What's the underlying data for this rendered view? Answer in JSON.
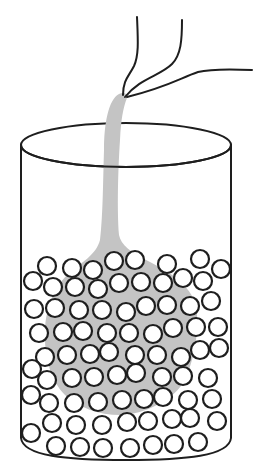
{
  "figure": {
    "title": "Liquid poured from tubes into a cylinder packed with beads",
    "colors": {
      "ink": "#1e1e1e",
      "liquid": "#c4c4c4",
      "background": "#ffffff",
      "bead_fill": "#ffffff"
    },
    "cylinder": {
      "top_ellipse": {
        "cx": 126,
        "cy": 145,
        "rx": 105,
        "ry": 22
      },
      "left_x": 21,
      "right_x": 231,
      "wall_top_y": 145,
      "wall_bottom_y": 438,
      "bottom_center_y": 460
    },
    "tubes": [
      {
        "name": "tube-left",
        "path": "M137 17 C138 40 139 55 134 66 C129 76 123 80 123 95"
      },
      {
        "name": "tube-middle",
        "path": "M182 20 C182 40 181 55 172 64 C160 76 140 78 125 97"
      },
      {
        "name": "tube-right",
        "path": "M252 70 C230 69 210 69 198 72 C180 78 170 86 127 97"
      }
    ],
    "liquid_stream": {
      "path": "M119 94 C123 92 128 93 127 98 C123 108 121 120 120 140 C118 170 117 210 119 235 C121 245 130 252 150 262 C170 272 190 285 196 305 C200 330 194 360 185 380 C175 398 150 412 125 415 C100 416 80 408 65 395 C50 380 44 355 45 330 C46 305 56 285 70 272 C82 262 96 255 100 240 C103 215 103 180 104 150 C104 125 108 100 119 94 Z"
    },
    "beads": {
      "radius": 9,
      "positions": [
        [
          47,
          266
        ],
        [
          72,
          268
        ],
        [
          93,
          270
        ],
        [
          114,
          261
        ],
        [
          135,
          260
        ],
        [
          167,
          264
        ],
        [
          200,
          259
        ],
        [
          221,
          269
        ],
        [
          33,
          281
        ],
        [
          53,
          287
        ],
        [
          75,
          287
        ],
        [
          98,
          289
        ],
        [
          119,
          283
        ],
        [
          141,
          282
        ],
        [
          163,
          283
        ],
        [
          183,
          278
        ],
        [
          203,
          281
        ],
        [
          34,
          309
        ],
        [
          55,
          308
        ],
        [
          79,
          310
        ],
        [
          102,
          310
        ],
        [
          126,
          312
        ],
        [
          146,
          306
        ],
        [
          167,
          305
        ],
        [
          190,
          306
        ],
        [
          211,
          301
        ],
        [
          39,
          333
        ],
        [
          63,
          332
        ],
        [
          83,
          331
        ],
        [
          107,
          333
        ],
        [
          129,
          333
        ],
        [
          153,
          334
        ],
        [
          173,
          328
        ],
        [
          196,
          327
        ],
        [
          218,
          327
        ],
        [
          45,
          357
        ],
        [
          67,
          355
        ],
        [
          90,
          354
        ],
        [
          109,
          352
        ],
        [
          135,
          355
        ],
        [
          157,
          355
        ],
        [
          181,
          357
        ],
        [
          200,
          350
        ],
        [
          219,
          348
        ],
        [
          32,
          369
        ],
        [
          47,
          380
        ],
        [
          72,
          378
        ],
        [
          94,
          377
        ],
        [
          117,
          375
        ],
        [
          136,
          373
        ],
        [
          162,
          377
        ],
        [
          183,
          376
        ],
        [
          208,
          378
        ],
        [
          31,
          395
        ],
        [
          49,
          403
        ],
        [
          74,
          403
        ],
        [
          98,
          402
        ],
        [
          122,
          400
        ],
        [
          144,
          399
        ],
        [
          163,
          397
        ],
        [
          188,
          400
        ],
        [
          212,
          399
        ],
        [
          52,
          423
        ],
        [
          76,
          425
        ],
        [
          102,
          425
        ],
        [
          127,
          422
        ],
        [
          148,
          421
        ],
        [
          172,
          419
        ],
        [
          190,
          418
        ],
        [
          217,
          421
        ],
        [
          31,
          433
        ],
        [
          56,
          446
        ],
        [
          80,
          447
        ],
        [
          103,
          448
        ],
        [
          130,
          448
        ],
        [
          153,
          445
        ],
        [
          174,
          444
        ],
        [
          198,
          442
        ]
      ]
    }
  }
}
